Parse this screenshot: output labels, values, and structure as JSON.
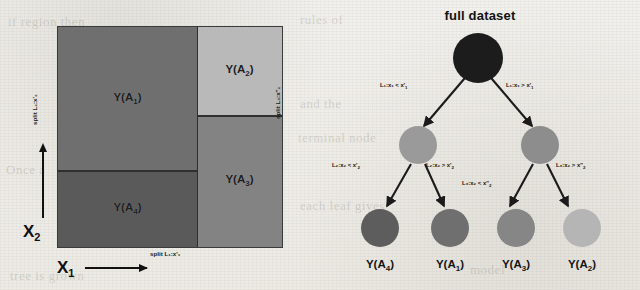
{
  "figure": {
    "panels": [
      "partition-square",
      "decision-tree"
    ],
    "background_ghost_text": [
      "if region then",
      "rules of",
      "and the",
      "terminal node",
      "Once a",
      "split",
      "partition",
      "each leaf gives",
      "model",
      "tree is grown"
    ]
  },
  "partition": {
    "x_axis_label": "X",
    "x_axis_sub": "1",
    "y_axis_label": "X",
    "y_axis_sub": "2",
    "split_labels": {
      "bottom": "split L₁:x'₁",
      "left": "split L₂:x'₂",
      "right": "split L₃:x''₂"
    },
    "regions": [
      {
        "id": "A1",
        "label": "Y(A",
        "sub": "1",
        "close": ")",
        "color": "#6f6f6f",
        "position": "top-left"
      },
      {
        "id": "A4",
        "label": "Y(A",
        "sub": "4",
        "close": ")",
        "color": "#5a5a5a",
        "position": "bottom-left"
      },
      {
        "id": "A2",
        "label": "Y(A",
        "sub": "2",
        "close": ")",
        "color": "#b9b9b9",
        "position": "top-right"
      },
      {
        "id": "A3",
        "label": "Y(A",
        "sub": "3",
        "close": ")",
        "color": "#838383",
        "position": "bottom-right"
      }
    ]
  },
  "tree": {
    "title": "full dataset",
    "root": {
      "color": "#1c1c1c"
    },
    "internal": [
      {
        "id": "left-internal",
        "color": "#9a9a9a"
      },
      {
        "id": "right-internal",
        "color": "#8d8d8d"
      }
    ],
    "leaves": [
      {
        "id": "A4",
        "label": "Y(A",
        "sub": "4",
        "close": ")",
        "color": "#5d5d5d"
      },
      {
        "id": "A1",
        "label": "Y(A",
        "sub": "1",
        "close": ")",
        "color": "#6f6f6f"
      },
      {
        "id": "A3",
        "label": "Y(A",
        "sub": "3",
        "close": ")",
        "color": "#868686"
      },
      {
        "id": "A2",
        "label": "Y(A",
        "sub": "2",
        "close": ")",
        "color": "#b5b5b5"
      }
    ],
    "edges": {
      "l1_left": {
        "pre": "L₁:x₁ < x'",
        "sub": "1"
      },
      "l1_right": {
        "pre": "L₁:x₁ > x'",
        "sub": "1"
      },
      "l2_left": {
        "pre": "L₂:x₂ < x'",
        "sub": "2"
      },
      "l2_right": {
        "pre": "L₂:x₂ > x'",
        "sub": "2"
      },
      "l3_left": {
        "pre": "L₃:x₂ < x''",
        "sub": "2"
      },
      "l3_right": {
        "pre": "L₃:x₂ > x''",
        "sub": "2"
      }
    }
  }
}
